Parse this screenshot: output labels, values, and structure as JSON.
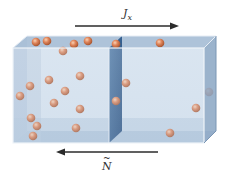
{
  "diagram": {
    "type": "flux-through-membrane",
    "labels": {
      "flux": "J",
      "flux_subscript": "x",
      "particle_count": "N",
      "particle_count_accent": "~"
    },
    "arrows": [
      {
        "name": "flux-arrow",
        "direction": "right",
        "x1": 75,
        "x2": 178,
        "y": 26
      },
      {
        "name": "particle-arrow",
        "direction": "left",
        "x1": 158,
        "x2": 57,
        "y": 152
      }
    ],
    "colors": {
      "box_front": "#cfdcea",
      "box_top": "#aec2d8",
      "box_side": "#8ea8c4",
      "box_edge": "#eef3f8",
      "membrane": "#3f6a98",
      "membrane_dark": "#28507e",
      "particle": "#d9825a",
      "particle_highlight": "#f6c9a8",
      "arrow": "#2b2b2b"
    },
    "particles": [
      {
        "x": 36,
        "y": 42
      },
      {
        "x": 47,
        "y": 41
      },
      {
        "x": 74,
        "y": 44
      },
      {
        "x": 88,
        "y": 41
      },
      {
        "x": 63,
        "y": 51
      },
      {
        "x": 30,
        "y": 86
      },
      {
        "x": 20,
        "y": 96
      },
      {
        "x": 49,
        "y": 80
      },
      {
        "x": 65,
        "y": 91
      },
      {
        "x": 80,
        "y": 76
      },
      {
        "x": 80,
        "y": 109
      },
      {
        "x": 54,
        "y": 103
      },
      {
        "x": 31,
        "y": 118
      },
      {
        "x": 37,
        "y": 126
      },
      {
        "x": 33,
        "y": 136
      },
      {
        "x": 76,
        "y": 128
      },
      {
        "x": 116,
        "y": 44
      },
      {
        "x": 126,
        "y": 83
      },
      {
        "x": 116,
        "y": 101
      },
      {
        "x": 160,
        "y": 43
      },
      {
        "x": 209,
        "y": 92
      },
      {
        "x": 196,
        "y": 108
      },
      {
        "x": 170,
        "y": 133
      }
    ]
  }
}
